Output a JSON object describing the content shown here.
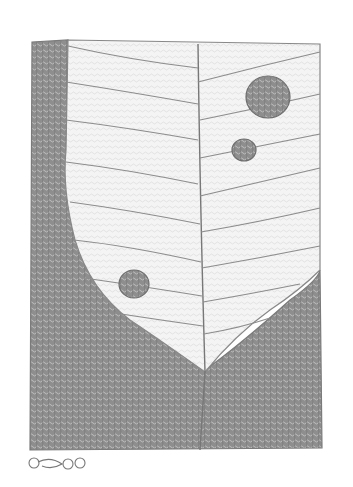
{
  "artwork": {
    "medium": "pencil drawing",
    "colors": {
      "paper": "#ffffff",
      "graphite_dark": "#7a7a7a",
      "graphite_mid": "#9a9a9a",
      "line": "#8c8c8c"
    },
    "spots": [
      {
        "cx": 268,
        "cy": 97,
        "r": 22
      },
      {
        "cx": 244,
        "cy": 150,
        "r": 12
      },
      {
        "cx": 134,
        "cy": 284,
        "r": 15
      }
    ]
  }
}
